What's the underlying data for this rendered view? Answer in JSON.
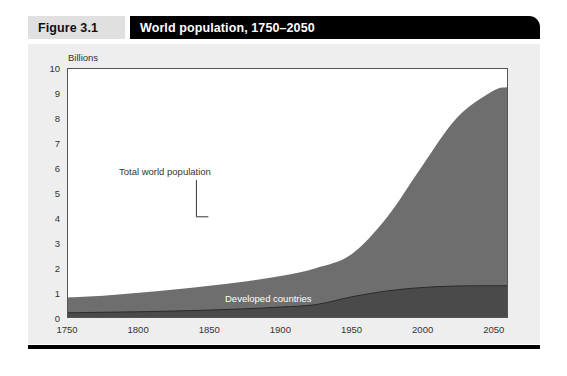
{
  "figure": {
    "number": "Figure 3.1",
    "title": "World population, 1750–2050"
  },
  "axis": {
    "unit_label": "Billions",
    "y_ticks": [
      "0",
      "1",
      "2",
      "3",
      "4",
      "5",
      "6",
      "7",
      "8",
      "9",
      "10"
    ],
    "x_ticks": [
      "1750",
      "1800",
      "1850",
      "1900",
      "1950",
      "2000",
      "2050"
    ]
  },
  "annotations": {
    "total": "Total world population",
    "developing": "Developing countries",
    "developed": "Developed countries"
  },
  "colors": {
    "developing_area": "#6e6e6e",
    "developed_area": "#4a4a4a",
    "plot_border": "#555555",
    "panel_background": "#eeeeee",
    "title_bar": "#000000",
    "number_box": "#e0e0e0"
  },
  "chart_data": {
    "type": "area",
    "title": "World population, 1750–2050",
    "subtitle": "",
    "xlabel": "",
    "ylabel": "Billions",
    "xlim": [
      1750,
      2060
    ],
    "ylim": [
      0,
      10
    ],
    "grid": false,
    "legend_position": "in-plot-annotations",
    "stacked": true,
    "x": [
      1750,
      1775,
      1800,
      1825,
      1850,
      1875,
      1900,
      1925,
      1950,
      1975,
      2000,
      2025,
      2050,
      2060
    ],
    "series": [
      {
        "name": "Developed countries",
        "values": [
          0.17,
          0.19,
          0.21,
          0.24,
          0.28,
          0.33,
          0.4,
          0.5,
          0.81,
          1.05,
          1.19,
          1.25,
          1.26,
          1.26
        ]
      },
      {
        "name": "Developing countries",
        "values": [
          0.62,
          0.67,
          0.77,
          0.87,
          0.98,
          1.1,
          1.25,
          1.47,
          1.71,
          2.95,
          4.89,
          6.8,
          7.85,
          8.0
        ]
      }
    ],
    "totals": {
      "name": "Total world population",
      "values": [
        0.79,
        0.86,
        0.98,
        1.11,
        1.26,
        1.43,
        1.65,
        1.97,
        2.52,
        4.0,
        6.08,
        8.05,
        9.11,
        9.26
      ]
    },
    "annotations": [
      {
        "text": "Total world population",
        "x": 1975,
        "y": 5.9
      },
      {
        "text": "Developing countries",
        "x": 2010,
        "y": 2.1
      },
      {
        "text": "Developed countries",
        "x": 2010,
        "y": 0.5
      }
    ]
  }
}
